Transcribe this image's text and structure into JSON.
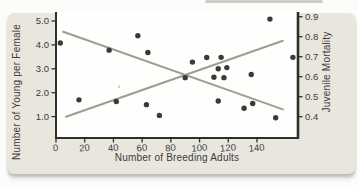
{
  "chart_data": {
    "type": "scatter",
    "title": "",
    "xlabel": "Number of Breeding Adults",
    "ylabel_left": "Number of Young per Female",
    "ylabel_right": "Juvenile Mortality",
    "x_tick_labels": [
      "0",
      "20",
      "40",
      "60",
      "80",
      "100",
      "120",
      "140"
    ],
    "x_range": [
      0,
      168
    ],
    "y_left_tick_labels": [
      "5.0",
      "4.0",
      "3.0",
      "2.0",
      "1.0"
    ],
    "y_left_range": [
      0.1,
      5.35
    ],
    "y_right_tick_labels": [
      "0.9",
      "0.8",
      "0.7",
      "0.6",
      "0.5",
      "0.4"
    ],
    "y_right_range": [
      0.29,
      0.92
    ],
    "grid": false,
    "legend": "none",
    "points_left_scale": [
      [
        3,
        4.08
      ],
      [
        16,
        1.7
      ],
      [
        37,
        3.78
      ],
      [
        42,
        1.63
      ],
      [
        57,
        4.38
      ],
      [
        63,
        1.5
      ],
      [
        64,
        3.68
      ],
      [
        72,
        1.05
      ],
      [
        90,
        2.63
      ],
      [
        95,
        3.28
      ],
      [
        105,
        3.47
      ],
      [
        110,
        2.65
      ],
      [
        113,
        3.0
      ],
      [
        113,
        1.65
      ],
      [
        115,
        3.48
      ],
      [
        117,
        2.63
      ],
      [
        119,
        3.05
      ],
      [
        131,
        1.35
      ],
      [
        136,
        2.76
      ],
      [
        137,
        1.55
      ],
      [
        149,
        5.08
      ],
      [
        153,
        0.95
      ],
      [
        165,
        3.48
      ]
    ],
    "trend_lines": [
      {
        "name": "young-per-female-trend",
        "scale": "left",
        "x": [
          5,
          158
        ],
        "y": [
          4.55,
          1.3
        ],
        "direction": "decreasing"
      },
      {
        "name": "juvenile-mortality-trend",
        "scale": "right",
        "x": [
          7,
          158
        ],
        "y": [
          0.4,
          0.78
        ],
        "direction": "increasing"
      }
    ],
    "colors": {
      "dots": "#3a3a3a",
      "trend_lines": "#9d9d95",
      "axis": "#2e2e2e",
      "text": "#3c3c3c",
      "card_bg": "#e9e6de",
      "plot_bg": "#fefefc"
    }
  }
}
